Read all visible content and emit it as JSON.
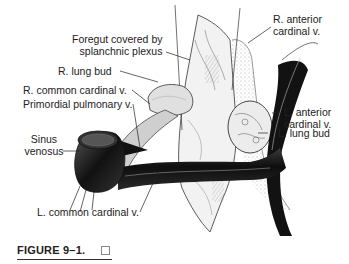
{
  "figure": {
    "caption": "FIGURE 9–1.",
    "caption_icon": "checkbox-icon",
    "labels": [
      {
        "id": "foregut",
        "lines": [
          "Foregut covered by",
          "splanchnic plexus"
        ]
      },
      {
        "id": "r-anterior-cardinal",
        "lines": [
          "R. anterior",
          "cardinal v."
        ]
      },
      {
        "id": "r-lung-bud",
        "lines": [
          "R. lung bud"
        ]
      },
      {
        "id": "r-common-cardinal",
        "lines": [
          "R. common cardinal v."
        ]
      },
      {
        "id": "primordial-pulmonary",
        "lines": [
          "Primordial pulmonary v."
        ]
      },
      {
        "id": "l-anterior-cardinal",
        "lines": [
          "L. anterior",
          "cardinal v."
        ]
      },
      {
        "id": "sinus-venosus",
        "lines": [
          "Sinus",
          "venosus"
        ]
      },
      {
        "id": "l-lung-bud",
        "lines": [
          "L. lung bud"
        ]
      },
      {
        "id": "l-common-cardinal",
        "lines": [
          "L. common cardinal v."
        ]
      }
    ]
  },
  "colors": {
    "ink": "#1a1a1a",
    "vessel_dark": "#151515",
    "tissue_light": "#e6e6e6",
    "background": "#ffffff"
  }
}
